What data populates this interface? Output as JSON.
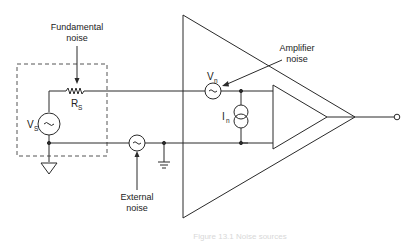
{
  "diagram": {
    "labels": {
      "fundamental_noise_line1": "Fundamental",
      "fundamental_noise_line2": "noise",
      "amplifier_noise_line1": "Amplifier",
      "amplifier_noise_line2": "noise",
      "external_noise_line1": "External",
      "external_noise_line2": "noise"
    },
    "components": {
      "source_voltage": {
        "symbol": "V",
        "subscript": "S"
      },
      "source_resistance": {
        "symbol": "R",
        "subscript": "S"
      },
      "noise_voltage": {
        "symbol": "V",
        "subscript": "n"
      },
      "noise_current": {
        "symbol": "I",
        "subscript": "n"
      },
      "ac_glyph": "~"
    },
    "caption": "Figure 13.1  Noise sources"
  },
  "colors": {
    "line": "#2a2a2a",
    "dashed_box": "#555555",
    "background": "#ffffff"
  }
}
